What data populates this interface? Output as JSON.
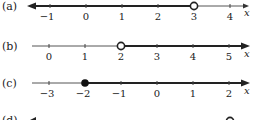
{
  "number_lines": [
    {
      "label": "(a)",
      "axis_var": "x",
      "ticks": [
        "−1",
        "0",
        "1",
        "2",
        "3",
        "4"
      ],
      "tick_values": [
        -1,
        0,
        1,
        2,
        3,
        4
      ],
      "endpoint": {
        "value": 3,
        "type": "open"
      },
      "shaded_direction": "left"
    },
    {
      "label": "(b)",
      "axis_var": "x",
      "ticks": [
        "0",
        "1",
        "2",
        "3",
        "4",
        "5"
      ],
      "tick_values": [
        0,
        1,
        2,
        3,
        4,
        5
      ],
      "endpoint": {
        "value": 2,
        "type": "open"
      },
      "shaded_direction": "right"
    },
    {
      "label": "(c)",
      "axis_var": "x",
      "ticks": [
        "−3",
        "−2",
        "−1",
        "0",
        "1",
        "2"
      ],
      "tick_values": [
        -3,
        -2,
        -1,
        0,
        1,
        2
      ],
      "endpoint": {
        "value": -2,
        "type": "closed"
      },
      "shaded_direction": "right"
    },
    {
      "label": "(d)",
      "partial": true
    }
  ],
  "colors": {
    "line": "#222222",
    "thin": "#555555",
    "bg": "#ffffff"
  }
}
